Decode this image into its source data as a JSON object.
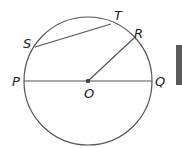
{
  "diagram": {
    "type": "circle-geometry",
    "center": {
      "label": "O",
      "x": 88,
      "y": 81
    },
    "radius": 64,
    "points": {
      "P": "P",
      "Q": "Q",
      "R": "R",
      "S": "S",
      "T": "T",
      "O": "O"
    },
    "segments": [
      {
        "name": "diameter",
        "from": "P",
        "to": "Q"
      },
      {
        "name": "radius",
        "from": "O",
        "to": "R"
      },
      {
        "name": "chord",
        "from": "S",
        "to": "T"
      }
    ],
    "colors": {
      "stroke": "#555555",
      "text": "#222222",
      "edge_bar": "#5a5a5a"
    }
  }
}
